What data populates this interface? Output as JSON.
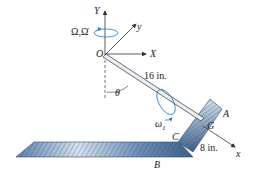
{
  "labels": {
    "Y_axis": "Y",
    "y_axis": "y",
    "X_axis": "X",
    "x_axis": "x",
    "origin": "O",
    "omega_big": "Ω,Ω̇",
    "rod_length": "16 in.",
    "theta": "θ",
    "omega1": "ω",
    "omega1_sub": "1",
    "point_A": "A",
    "point_B": "B",
    "point_C": "C",
    "point_G": "G",
    "plate_length": "8 in."
  },
  "colors": {
    "blue_arrow": "#2a7ab8",
    "plate_dark": "#4a6f9a",
    "plate_light": "#c9d8ea",
    "line": "#333333"
  }
}
